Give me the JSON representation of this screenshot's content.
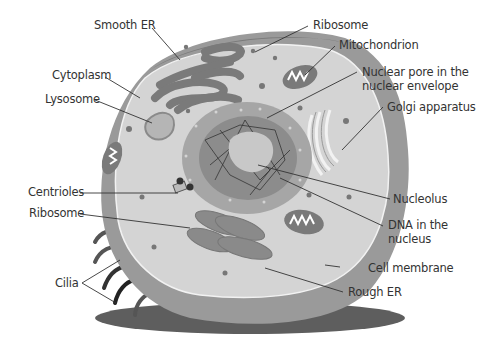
{
  "diagram": {
    "colors": {
      "background": "#ffffff",
      "outer_cytoplasm": "#9a9a9a",
      "cytoplasm_inner": "#d4d4d4",
      "membrane_line": "#f2f2f2",
      "nuclear_envelope": "#a6a6a6",
      "nucleoplasm": "#8c8c8c",
      "nucleolus": "#c8c8c8",
      "organelle_dark": "#7a7a7a",
      "shadow": "#5e5e5e",
      "leader_line": "#333333"
    },
    "labels": {
      "smooth_er": "Smooth ER",
      "ribosome_top": "Ribosome",
      "mitochondrion": "Mitochondrion",
      "nuclear_pore": "Nuclear pore in the nuclear envelope",
      "cytoplasm": "Cytoplasm",
      "lysosome": "Lysosome",
      "golgi": "Golgi apparatus",
      "centrioles": "Centrioles",
      "nucleolus": "Nucleolus",
      "ribosome_left": "Ribosome",
      "dna": "DNA in the nucleus",
      "cell_membrane": "Cell membrane",
      "cilia": "Cilia",
      "rough_er": "Rough ER"
    }
  }
}
